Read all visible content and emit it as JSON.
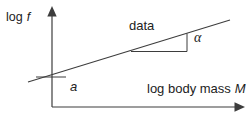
{
  "figure": {
    "background": "#ffffff",
    "colors": {
      "line": "#3d3d3d",
      "text": "#222222"
    },
    "y_axis_label": {
      "prefix": "log",
      "symbol": "f"
    },
    "x_axis_label": {
      "prefix": "log body mass",
      "symbol": "M"
    },
    "line_label": "data",
    "slope_angle_label": "α",
    "intercept_label": "a"
  }
}
